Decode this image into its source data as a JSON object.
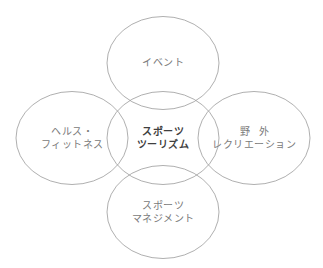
{
  "diagram": {
    "title": "",
    "stroke_color": "#9a9a9a",
    "outer_text_color": "#7a7a7a",
    "center_text_color": "#3f3f3f",
    "nodes": [
      {
        "id": "top",
        "role": "outer",
        "lines": [
          "イベント"
        ]
      },
      {
        "id": "left",
        "role": "outer",
        "lines": [
          "ヘルス・",
          "フィットネス"
        ]
      },
      {
        "id": "center",
        "role": "center",
        "lines": [
          "スポーツ",
          "ツーリズム"
        ]
      },
      {
        "id": "right",
        "role": "outer",
        "lines": [
          "野外",
          "レクリエーション"
        ]
      },
      {
        "id": "bottom",
        "role": "outer",
        "lines": [
          "スポーツ",
          "マネジメント"
        ]
      }
    ]
  }
}
